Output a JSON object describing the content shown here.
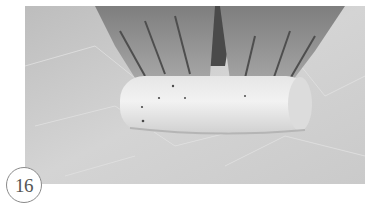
{
  "figure": {
    "step_number": "16",
    "photo_description": "Hands rolling a cylindrical log of dough on a marble surface",
    "colors": {
      "surface": "#cfcfcf",
      "dough": "#eeeeee",
      "hands": "#9a9a9a",
      "badge_border": "#8a8a8a",
      "badge_text": "#555555"
    }
  }
}
